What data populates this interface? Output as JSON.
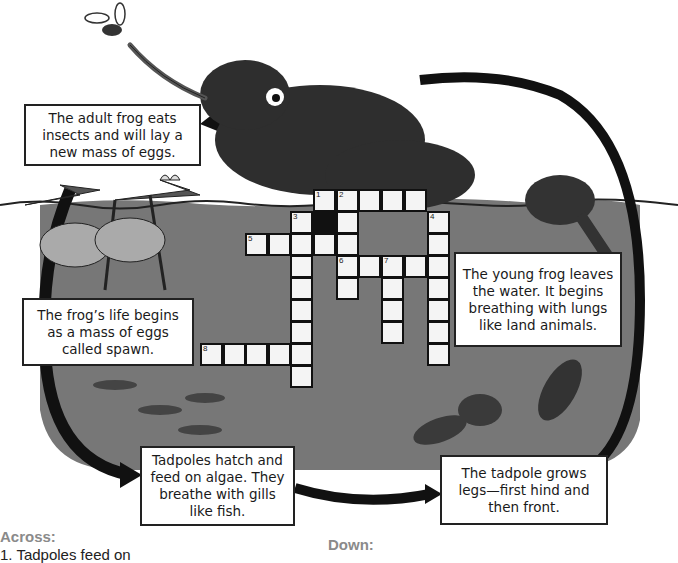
{
  "captions": {
    "adult": "The adult frog eats insects and will lay a new mass of eggs.",
    "eggs": "The frog’s life begins as a mass of eggs called spawn.",
    "young_frog": "The young frog leaves the water. It begins breathing with lungs like land animals.",
    "tadpoles": "Tadpoles hatch and feed on algae. They breathe with gills like fish.",
    "legs": "The tadpole grows legs—first hind and then front."
  },
  "crossword": {
    "cell_size": 22.5,
    "origin_x": 245,
    "origin_y": 189,
    "numbers": [
      "1",
      "2",
      "3",
      "4",
      "5",
      "6",
      "7",
      "8"
    ]
  },
  "clues": {
    "across_heading": "Across:",
    "down_heading": "Down:",
    "across_1": "1. Tadpoles feed on"
  },
  "colors": {
    "water": "#777777",
    "frog": "#2e2e2e",
    "arrow": "#111111",
    "cell": "#f4f4f4"
  }
}
